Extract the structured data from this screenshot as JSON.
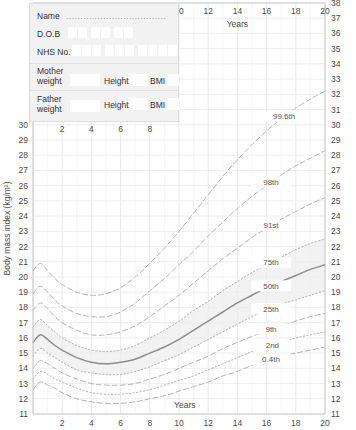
{
  "form": {
    "name_label": "Name",
    "name_dots": "...................................",
    "dob_label": "D.O.B",
    "nhs_label": "NHS No.",
    "mother_label_line1": "Mother",
    "mother_label_line2": "weight",
    "father_label_line1": "Father",
    "father_label_line2": "weight",
    "height_label": "Height",
    "bmi_label": "BMI",
    "dob_boxes": 6,
    "nhs_boxes": 10,
    "name_value": "",
    "mother_weight_value": "",
    "mother_height_value": "",
    "mother_bmi_value": "",
    "father_weight_value": "",
    "father_height_value": "",
    "father_bmi_value": ""
  },
  "chart_data": {
    "type": "line",
    "title": "",
    "xlabel": "Years",
    "ylabel": "Body mass index (kg/m²)",
    "xlim": [
      0,
      20
    ],
    "ylim": [
      11,
      38
    ],
    "grid": true,
    "legend": "inline-right-labels",
    "axis_top_label": "Years",
    "axis_bottom_label": "Years",
    "x_ticks_bottom": [
      2,
      4,
      6,
      8,
      10,
      12,
      14,
      16,
      18,
      20
    ],
    "x_ticks_top": [
      10,
      12,
      14,
      16,
      18,
      20
    ],
    "x_ticks_inner": [
      2,
      4,
      6,
      8
    ],
    "y_ticks_left": [
      30,
      29,
      28,
      27,
      26,
      25,
      24,
      23,
      22,
      21,
      20,
      19,
      18,
      17,
      16,
      15,
      14,
      13,
      12,
      11
    ],
    "y_ticks_right": [
      38,
      37,
      36,
      35,
      34,
      33,
      32,
      31,
      30,
      29,
      28,
      27,
      26,
      25,
      24,
      23,
      22,
      21,
      20,
      19,
      18,
      17,
      16,
      15,
      14,
      13,
      12,
      11
    ],
    "shaded_band": {
      "lower": "25th",
      "upper": "75th",
      "color": "#ededed"
    },
    "x": [
      0,
      0.5,
      1,
      1.5,
      2,
      3,
      4,
      5,
      6,
      7,
      8,
      9,
      10,
      11,
      12,
      13,
      14,
      15,
      16,
      17,
      18,
      19,
      20
    ],
    "series": [
      {
        "name": "99.6th",
        "style": "dashed",
        "label_x": 17.2,
        "values": [
          20.4,
          20.9,
          20.4,
          19.9,
          19.5,
          19.0,
          18.8,
          18.9,
          19.3,
          20.0,
          20.9,
          21.9,
          23.0,
          24.2,
          25.4,
          26.6,
          27.7,
          28.7,
          29.6,
          30.4,
          31.1,
          31.7,
          32.2
        ]
      },
      {
        "name": "98th",
        "style": "dashed",
        "label_x": 16.3,
        "values": [
          18.9,
          19.4,
          19.0,
          18.5,
          18.1,
          17.6,
          17.4,
          17.4,
          17.7,
          18.3,
          19.1,
          19.9,
          20.8,
          21.7,
          22.7,
          23.6,
          24.5,
          25.3,
          26.0,
          26.7,
          27.3,
          27.8,
          28.3
        ]
      },
      {
        "name": "91st",
        "style": "dashed",
        "label_x": 16.3,
        "values": [
          17.8,
          18.3,
          17.9,
          17.4,
          17.0,
          16.5,
          16.2,
          16.2,
          16.4,
          16.8,
          17.4,
          18.1,
          18.8,
          19.6,
          20.4,
          21.2,
          21.9,
          22.6,
          23.2,
          23.8,
          24.3,
          24.8,
          25.2
        ]
      },
      {
        "name": "75th",
        "style": "dotted",
        "label_x": 16.3,
        "values": [
          16.7,
          17.2,
          16.8,
          16.4,
          16.0,
          15.5,
          15.2,
          15.1,
          15.2,
          15.5,
          16.0,
          16.5,
          17.1,
          17.8,
          18.4,
          19.1,
          19.7,
          20.3,
          20.8,
          21.3,
          21.8,
          22.2,
          22.5
        ]
      },
      {
        "name": "50th",
        "style": "solid",
        "label_x": 16.3,
        "values": [
          15.7,
          16.2,
          15.9,
          15.5,
          15.2,
          14.7,
          14.4,
          14.3,
          14.4,
          14.6,
          15.0,
          15.4,
          15.9,
          16.5,
          17.1,
          17.7,
          18.3,
          18.8,
          19.3,
          19.7,
          20.1,
          20.5,
          20.8
        ]
      },
      {
        "name": "25th",
        "style": "dotted",
        "label_x": 16.3,
        "values": [
          14.8,
          15.3,
          15.0,
          14.7,
          14.4,
          13.9,
          13.7,
          13.6,
          13.6,
          13.8,
          14.1,
          14.5,
          14.9,
          15.4,
          15.9,
          16.4,
          16.9,
          17.4,
          17.8,
          18.2,
          18.5,
          18.8,
          19.1
        ]
      },
      {
        "name": "9th",
        "style": "dashed",
        "label_x": 16.3,
        "values": [
          14.0,
          14.5,
          14.3,
          14.0,
          13.7,
          13.3,
          13.0,
          12.9,
          12.9,
          13.0,
          13.3,
          13.6,
          14.0,
          14.4,
          14.8,
          15.3,
          15.7,
          16.1,
          16.5,
          16.8,
          17.1,
          17.4,
          17.6
        ]
      },
      {
        "name": "2nd",
        "style": "dotted",
        "label_x": 16.4,
        "values": [
          13.3,
          13.8,
          13.6,
          13.3,
          13.1,
          12.7,
          12.4,
          12.3,
          12.3,
          12.4,
          12.6,
          12.9,
          13.2,
          13.5,
          13.9,
          14.3,
          14.7,
          15.1,
          15.4,
          15.7,
          16.0,
          16.2,
          16.4
        ]
      },
      {
        "name": "0.4th",
        "style": "dashed",
        "label_x": 16.3,
        "values": [
          12.6,
          13.1,
          12.9,
          12.7,
          12.4,
          12.0,
          11.8,
          11.7,
          11.7,
          11.8,
          12.0,
          12.2,
          12.5,
          12.8,
          13.1,
          13.5,
          13.8,
          14.2,
          14.5,
          14.8,
          15.0,
          15.2,
          15.4
        ]
      }
    ]
  }
}
